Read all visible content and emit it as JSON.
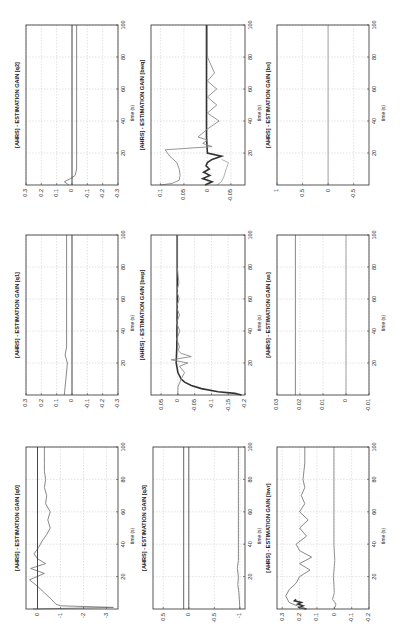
{
  "page": {
    "orientation": "rotated-90-ccw",
    "layout": "3x3 subplot grid"
  },
  "chart_data": [
    {
      "id": "q0",
      "type": "line",
      "title": "[AHRS] - ESTIMATION GAIN [q0]",
      "xlabel": "time (s)",
      "ylabel": "",
      "xlim": [
        0,
        100
      ],
      "ylim": [
        -3.5,
        0.5
      ],
      "xticks": [
        20,
        40,
        60,
        80,
        100
      ],
      "yticks": [
        0,
        -1,
        -2,
        -3
      ],
      "ytick_labels": [
        "0",
        "-1",
        "-2",
        "-3"
      ],
      "grid": true,
      "series": [
        {
          "name": "gain",
          "color": "#7a7a7a",
          "x": [
            0,
            1,
            2,
            3,
            6,
            10,
            14,
            18,
            22,
            25,
            28,
            31,
            34,
            38,
            42,
            46,
            50,
            55,
            60,
            65,
            70,
            75,
            80,
            85,
            90,
            95,
            100
          ],
          "values": [
            0.2,
            -3.3,
            -1.0,
            -0.8,
            -0.6,
            -0.3,
            0.0,
            0.35,
            -0.3,
            0.3,
            -0.35,
            0.0,
            0.15,
            -0.05,
            -0.2,
            -0.4,
            -0.55,
            -0.45,
            -0.55,
            -0.35,
            -0.4,
            -0.3,
            -0.35,
            -0.3,
            -0.3,
            -0.3,
            -0.3
          ]
        },
        {
          "name": "ref",
          "color": "#333333",
          "x": [
            0,
            100
          ],
          "values": [
            0.0,
            0.0
          ]
        }
      ]
    },
    {
      "id": "q1",
      "type": "line",
      "title": "[AHRS] - ESTIMATION GAIN [q1]",
      "xlabel": "time (s)",
      "ylabel": "",
      "xlim": [
        0,
        100
      ],
      "ylim": [
        -0.3,
        0.3
      ],
      "xticks": [
        20,
        40,
        60,
        80,
        100
      ],
      "yticks": [
        0.3,
        0.2,
        0.1,
        0,
        -0.1,
        -0.2,
        -0.3
      ],
      "ytick_labels": [
        "0.3",
        "0.2",
        "0.1",
        "0",
        "-0.1",
        "-0.2",
        "-0.3"
      ],
      "grid": true,
      "series": [
        {
          "name": "gain",
          "color": "#7a7a7a",
          "x": [
            0,
            10,
            20,
            25,
            30,
            40,
            60,
            80,
            100
          ],
          "values": [
            0.05,
            0.04,
            0.03,
            0.045,
            0.035,
            0.035,
            0.035,
            0.035,
            0.035
          ]
        },
        {
          "name": "ref",
          "color": "#333333",
          "x": [
            0,
            100
          ],
          "values": [
            0.0,
            0.0
          ]
        }
      ]
    },
    {
      "id": "q2",
      "type": "line",
      "title": "[AHRS] - ESTIMATION GAIN [q2]",
      "xlabel": "time (s)",
      "ylabel": "",
      "xlim": [
        0,
        100
      ],
      "ylim": [
        -0.3,
        0.3
      ],
      "xticks": [
        20,
        40,
        60,
        80,
        100
      ],
      "yticks": [
        0.3,
        0.2,
        0.1,
        0,
        -0.1,
        -0.2,
        -0.3
      ],
      "ytick_labels": [
        "0.3",
        "0.2",
        "0.1",
        "0",
        "-0.1",
        "-0.2",
        "-0.3"
      ],
      "grid": true,
      "series": [
        {
          "name": "gain",
          "color": "#7a7a7a",
          "x": [
            0,
            2,
            4,
            6,
            10,
            20,
            40,
            60,
            80,
            100
          ],
          "values": [
            0.02,
            0.05,
            0.01,
            -0.02,
            -0.03,
            -0.03,
            -0.03,
            -0.03,
            -0.03,
            -0.03
          ]
        },
        {
          "name": "ref",
          "color": "#333333",
          "x": [
            0,
            100
          ],
          "values": [
            0.0,
            0.0
          ]
        }
      ]
    },
    {
      "id": "q3",
      "type": "line",
      "title": "[AHRS] - ESTIMATION GAIN [q3]",
      "xlabel": "time (s)",
      "ylabel": "",
      "xlim": [
        0,
        100
      ],
      "ylim": [
        -1.1,
        0.7
      ],
      "xticks": [
        20,
        40,
        60,
        80,
        100
      ],
      "yticks": [
        0.5,
        0,
        -0.5,
        -1
      ],
      "ytick_labels": [
        "0.5",
        "0",
        "-0.5",
        "-1"
      ],
      "grid": true,
      "series": [
        {
          "name": "gain",
          "color": "#7a7a7a",
          "x": [
            0,
            10,
            15,
            20,
            25,
            30,
            40,
            60,
            80,
            100
          ],
          "values": [
            -1.0,
            -0.98,
            -0.96,
            -0.97,
            -0.95,
            -0.97,
            -0.97,
            -0.97,
            -0.97,
            -0.97
          ]
        },
        {
          "name": "ref-a",
          "color": "#555555",
          "x": [
            0,
            100
          ],
          "values": [
            0.1,
            0.1
          ]
        },
        {
          "name": "ref-b",
          "color": "#555555",
          "x": [
            0,
            100
          ],
          "values": [
            0.0,
            0.0
          ]
        }
      ]
    },
    {
      "id": "bwp",
      "type": "line",
      "title": "[AHRS] - ESTIMATION GAIN [bwp]",
      "xlabel": "time (s)",
      "ylabel": "",
      "xlim": [
        0,
        100
      ],
      "ylim": [
        -0.2,
        0.08
      ],
      "xticks": [
        20,
        40,
        60,
        80,
        100
      ],
      "yticks": [
        0.05,
        0,
        -0.05,
        -0.1,
        -0.15,
        -0.2
      ],
      "ytick_labels": [
        "0.05",
        "0",
        "-0.05",
        "-0.1",
        "-0.15",
        "-0.2"
      ],
      "grid": true,
      "series": [
        {
          "name": "gain-dark",
          "color": "#333333",
          "x": [
            0,
            1,
            2,
            4,
            6,
            8,
            10,
            14,
            20,
            30,
            60,
            100
          ],
          "values": [
            -0.19,
            -0.17,
            -0.12,
            -0.07,
            -0.04,
            -0.02,
            -0.01,
            0.0,
            0.005,
            0.003,
            0.002,
            0.002
          ]
        },
        {
          "name": "gain-light",
          "color": "#8a8a8a",
          "x": [
            0,
            5,
            10,
            14,
            18,
            20,
            22,
            24,
            26,
            28,
            30,
            35,
            40,
            45,
            50,
            55,
            60,
            65,
            70,
            80,
            90,
            100
          ],
          "values": [
            0.0,
            0.0,
            -0.01,
            -0.02,
            -0.005,
            -0.03,
            0.02,
            -0.04,
            -0.01,
            0.0,
            -0.005,
            0.003,
            -0.006,
            0.004,
            -0.005,
            0.004,
            -0.004,
            0.003,
            -0.003,
            0.002,
            0.002,
            0.002
          ]
        }
      ]
    },
    {
      "id": "bwq",
      "type": "line",
      "title": "[AHRS] - ESTIMATION GAIN [bwq]",
      "xlabel": "time (s)",
      "ylabel": "",
      "xlim": [
        0,
        100
      ],
      "ylim": [
        -0.08,
        0.12
      ],
      "xticks": [
        20,
        40,
        60,
        80,
        100
      ],
      "yticks": [
        0.1,
        0.05,
        0,
        -0.05
      ],
      "ytick_labels": [
        "0.1",
        "0.05",
        "0",
        "-0.05"
      ],
      "grid": true,
      "series": [
        {
          "name": "gain-dark",
          "color": "#333333",
          "x": [
            0,
            2,
            4,
            6,
            8,
            10,
            12,
            14,
            16,
            18,
            20,
            30,
            60,
            100
          ],
          "values": [
            0.005,
            -0.01,
            0.01,
            -0.005,
            0.008,
            -0.004,
            0.003,
            0.0,
            -0.01,
            -0.03,
            0.0,
            0.002,
            0.002,
            0.002
          ]
        },
        {
          "name": "gain-light",
          "color": "#8a8a8a",
          "x": [
            0,
            1,
            3,
            6,
            10,
            14,
            18,
            22,
            24,
            26,
            28,
            30,
            35,
            40,
            45,
            50,
            55,
            60,
            65,
            70,
            80,
            90,
            100
          ],
          "values": [
            0.1,
            0.075,
            0.06,
            0.058,
            0.06,
            0.065,
            0.08,
            0.09,
            -0.01,
            0.01,
            0.0,
            0.02,
            0.0,
            -0.025,
            0.0,
            -0.02,
            0.0,
            -0.02,
            0.0,
            -0.015,
            0.0,
            0.0,
            0.0
          ]
        },
        {
          "name": "gain-light-2",
          "color": "#aaaaaa",
          "x": [
            0,
            2,
            5,
            10,
            14,
            16
          ],
          "values": [
            -0.02,
            -0.03,
            -0.035,
            -0.04,
            -0.045,
            -0.03
          ]
        }
      ]
    },
    {
      "id": "bwr",
      "type": "line",
      "title": "[AHRS] - ESTIMATION GAIN [bwr]",
      "xlabel": "time (s)",
      "ylabel": "",
      "xlim": [
        0,
        100
      ],
      "ylim": [
        -0.2,
        0.33
      ],
      "xticks": [
        20,
        40,
        60,
        80,
        100
      ],
      "yticks": [
        0.3,
        0.2,
        0.1,
        0,
        -0.1,
        -0.2
      ],
      "ytick_labels": [
        "0.3",
        "0.2",
        "0.1",
        "0",
        "-0.1",
        "-0.2"
      ],
      "grid": true,
      "series": [
        {
          "name": "gain-dark",
          "color": "#333333",
          "x": [
            0,
            1,
            2,
            3,
            4,
            5,
            6
          ],
          "values": [
            0.16,
            0.2,
            0.18,
            0.21,
            0.19,
            0.23,
            0.22
          ]
        },
        {
          "name": "gain-light",
          "color": "#7a7a7a",
          "x": [
            0,
            4,
            8,
            12,
            16,
            20,
            24,
            28,
            32,
            36,
            40,
            45,
            50,
            55,
            60,
            65,
            70,
            75,
            80,
            90,
            100
          ],
          "values": [
            0.17,
            0.26,
            0.28,
            0.26,
            0.22,
            0.2,
            0.14,
            0.2,
            0.13,
            0.2,
            0.22,
            0.16,
            0.2,
            0.15,
            0.2,
            0.17,
            0.19,
            0.17,
            0.18,
            0.17,
            0.17
          ]
        },
        {
          "name": "gain-low",
          "color": "#8a8a8a",
          "x": [
            0,
            3,
            6,
            10,
            20,
            30,
            40,
            60,
            80,
            100
          ],
          "values": [
            0.0,
            -0.01,
            0.01,
            0.0,
            0.005,
            -0.003,
            0.002,
            0.002,
            0.002,
            0.002
          ]
        }
      ]
    },
    {
      "id": "as",
      "type": "line",
      "title": "[AHRS] - ESTIMATION GAIN [as]",
      "xlabel": "time (s)",
      "ylabel": "",
      "xlim": [
        0,
        100
      ],
      "ylim": [
        -0.01,
        0.03
      ],
      "xticks": [
        20,
        40,
        60,
        80,
        100
      ],
      "yticks": [
        0.03,
        0.02,
        0.01,
        0,
        -0.01
      ],
      "ytick_labels": [
        "0.03",
        "0.02",
        "0.01",
        "0",
        "-0.01"
      ],
      "grid": true,
      "series": [
        {
          "name": "gain",
          "color": "#7a7a7a",
          "x": [
            0,
            100
          ],
          "values": [
            0.022,
            0.022
          ]
        },
        {
          "name": "ref",
          "color": "#9a9a9a",
          "x": [
            0,
            100
          ],
          "values": [
            0.0,
            0.0
          ]
        }
      ]
    },
    {
      "id": "bs",
      "type": "line",
      "title": "[AHRS] - ESTIMATION GAIN [bs]",
      "xlabel": "time (s)",
      "ylabel": "",
      "xlim": [
        0,
        100
      ],
      "ylim": [
        -0.8,
        1.0
      ],
      "xticks": [
        20,
        40,
        60,
        80,
        100
      ],
      "yticks": [
        1,
        0.5,
        0,
        -0.5
      ],
      "ytick_labels": [
        "1",
        "0.5",
        "0",
        "-0.5"
      ],
      "grid": true,
      "series": [
        {
          "name": "gain",
          "color": "#9a9a9a",
          "x": [
            0,
            100
          ],
          "values": [
            0.0,
            0.0
          ]
        }
      ]
    }
  ],
  "cells": [
    {
      "chart": "q2",
      "x": 26,
      "y": 25,
      "w": 92,
      "h": 160
    },
    {
      "chart": "bwq",
      "x": 151,
      "y": 25,
      "w": 94,
      "h": 160
    },
    {
      "chart": "bs",
      "x": 277,
      "y": 25,
      "w": 92,
      "h": 160
    },
    {
      "chart": "q1",
      "x": 26,
      "y": 235,
      "w": 92,
      "h": 160
    },
    {
      "chart": "bwp",
      "x": 151,
      "y": 235,
      "w": 94,
      "h": 160
    },
    {
      "chart": "as",
      "x": 277,
      "y": 235,
      "w": 92,
      "h": 160
    },
    {
      "chart": "q0",
      "x": 26,
      "y": 447,
      "w": 92,
      "h": 162
    },
    {
      "chart": "q3",
      "x": 153,
      "y": 447,
      "w": 92,
      "h": 162
    },
    {
      "chart": "bwr",
      "x": 277,
      "y": 447,
      "w": 92,
      "h": 162
    }
  ]
}
